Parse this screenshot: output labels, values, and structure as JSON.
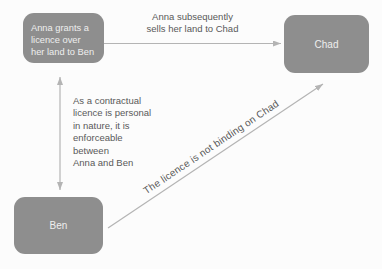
{
  "colors": {
    "background": "#fcfcfc",
    "box_fill": "#8e8e8e",
    "box_text": "#eeeeee",
    "arrow": "#b4b4b4",
    "label_text": "#595959"
  },
  "boxes": {
    "anna": {
      "lines": [
        "Anna grants a",
        "licence over",
        "her land to Ben"
      ]
    },
    "chad": {
      "label": "Chad"
    },
    "ben": {
      "label": "Ben"
    }
  },
  "labels": {
    "sale": {
      "lines": [
        "Anna subsequently",
        "sells her land to Chad"
      ]
    },
    "contractual": {
      "lines": [
        "As a contractual",
        "licence is personal",
        "in nature, it is",
        "enforceable",
        "between",
        "Anna and Ben"
      ]
    },
    "not_binding": {
      "text": "The licence is not binding on Chad"
    }
  }
}
